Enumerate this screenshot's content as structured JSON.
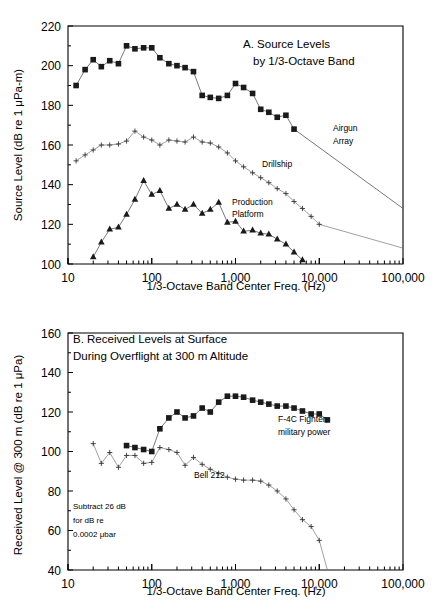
{
  "figure": {
    "name": "two-panel-acoustic-source-and-received-levels"
  },
  "chart_data": [
    {
      "id": "panel-a",
      "type": "line",
      "title": "A.  Source Levels",
      "title_line2": "by 1/3-Octave Band",
      "xlabel": "1/3-Octave Band Center Freq. (Hz)",
      "ylabel": "Source Level (dB re 1 μPa-m)",
      "xscale": "log",
      "xlim": [
        10,
        100000
      ],
      "ylim": [
        100,
        220
      ],
      "xticks": [
        10,
        100,
        1000,
        10000,
        100000
      ],
      "xticklabels": [
        "10",
        "100",
        "1,000",
        "10,000",
        "100,000"
      ],
      "yticks": [
        100,
        120,
        140,
        160,
        180,
        200,
        220
      ],
      "yticklabels": [
        "100",
        "120",
        "140",
        "160",
        "180",
        "200",
        "220"
      ],
      "grid": false,
      "legend_position": "inline-annotations",
      "series": [
        {
          "name": "Airgun Array",
          "label": "Airgun",
          "label_line2": "Array",
          "marker": "square",
          "x": [
            12.5,
            16,
            20,
            25,
            31.5,
            40,
            50,
            63,
            80,
            100,
            125,
            160,
            200,
            250,
            315,
            400,
            500,
            630,
            800,
            1000,
            1250,
            1600,
            2000,
            2500,
            3150,
            4000,
            5000
          ],
          "y": [
            190,
            198,
            203,
            199.5,
            202.5,
            201,
            210,
            208.5,
            209,
            209,
            204,
            201,
            200,
            199,
            197,
            185,
            184,
            183.5,
            185,
            191,
            189,
            186,
            178,
            176.5,
            174,
            175,
            168
          ],
          "extension_line": {
            "from": [
              5000,
              168
            ],
            "to": [
              100000,
              128
            ]
          }
        },
        {
          "name": "Drillship",
          "label": "Drillship",
          "marker": "plus",
          "x": [
            12.5,
            16,
            20,
            25,
            31.5,
            40,
            50,
            63,
            80,
            100,
            125,
            160,
            200,
            250,
            315,
            400,
            500,
            630,
            800,
            1000,
            1250,
            1600,
            2000,
            2500,
            3150,
            4000,
            5000,
            6300,
            8000,
            10000
          ],
          "y": [
            152,
            155,
            157.5,
            160,
            160,
            160.5,
            162,
            167,
            164,
            162.5,
            160,
            162.5,
            162,
            161.5,
            164,
            161.5,
            161,
            159,
            156,
            152,
            149,
            146,
            143.5,
            141,
            138,
            135.5,
            131.5,
            128,
            124,
            120
          ],
          "extension_line": {
            "from": [
              10000,
              120
            ],
            "to": [
              100000,
              108
            ]
          }
        },
        {
          "name": "Production Platform",
          "label": "Production",
          "label_line2": "Platform",
          "marker": "triangle",
          "x": [
            20,
            25,
            31.5,
            40,
            50,
            63,
            80,
            100,
            125,
            160,
            200,
            250,
            315,
            400,
            500,
            630,
            800,
            1000,
            1250,
            1600,
            2000,
            2500,
            3150,
            4000,
            5000,
            6300
          ],
          "y": [
            103.5,
            111,
            117.5,
            118.5,
            125,
            132.5,
            142,
            135,
            137,
            128,
            130,
            127.5,
            130,
            125.5,
            127.5,
            131,
            121,
            121.5,
            116.5,
            117,
            115.5,
            115,
            112.5,
            110,
            106,
            102
          ]
        }
      ]
    },
    {
      "id": "panel-b",
      "type": "line",
      "title": "B.  Received Levels at Surface",
      "title_line2": "During Overflight at 300 m Altitude",
      "xlabel": "1/3-Octave Band Center Freq. (Hz)",
      "ylabel": "Received Level @ 300 m (dB re 1 μPa)",
      "xscale": "log",
      "xlim": [
        10,
        100000
      ],
      "ylim": [
        40,
        160
      ],
      "xticks": [
        10,
        100,
        1000,
        10000,
        100000
      ],
      "xticklabels": [
        "10",
        "100",
        "1,000",
        "10,000",
        "100,000"
      ],
      "yticks": [
        40,
        60,
        80,
        100,
        120,
        140,
        160
      ],
      "yticklabels": [
        "40",
        "60",
        "80",
        "100",
        "120",
        "140",
        "160"
      ],
      "grid": false,
      "note": "Subtract 26 dB",
      "note_line2": "for dB re",
      "note_line3": "0.0002 μbar",
      "legend_position": "inline-annotations",
      "series": [
        {
          "name": "F-4C Fighter, military power",
          "label": "F-4C Fighter,",
          "label_line2": "military power",
          "marker": "square",
          "x": [
            50,
            63,
            80,
            100,
            125,
            160,
            200,
            250,
            315,
            400,
            500,
            630,
            800,
            1000,
            1250,
            1600,
            2000,
            2500,
            3150,
            4000,
            5000,
            6300,
            8000,
            10000,
            12500
          ],
          "y": [
            103,
            102,
            101,
            100,
            111.5,
            117,
            120,
            117,
            118,
            122,
            120,
            125,
            128,
            128,
            127.5,
            126,
            125,
            124,
            123,
            123,
            122,
            120.5,
            119,
            119,
            116
          ]
        },
        {
          "name": "Bell 212",
          "label": "Bell 212",
          "marker": "plus",
          "x": [
            20,
            25,
            31.5,
            40,
            50,
            63,
            80,
            100,
            125,
            160,
            200,
            250,
            315,
            400,
            500,
            630,
            800,
            1000,
            1250,
            1600,
            2000,
            2500,
            3150,
            4000,
            5000,
            6300,
            8000,
            10000,
            12500
          ],
          "y": [
            104,
            94,
            99.5,
            92,
            98,
            98,
            94,
            94.5,
            102,
            101,
            99.5,
            93,
            97,
            93.5,
            91,
            89,
            87,
            86,
            85.5,
            85.5,
            85,
            83,
            80,
            76,
            70.5,
            65.5,
            62,
            55,
            30
          ]
        }
      ]
    }
  ]
}
